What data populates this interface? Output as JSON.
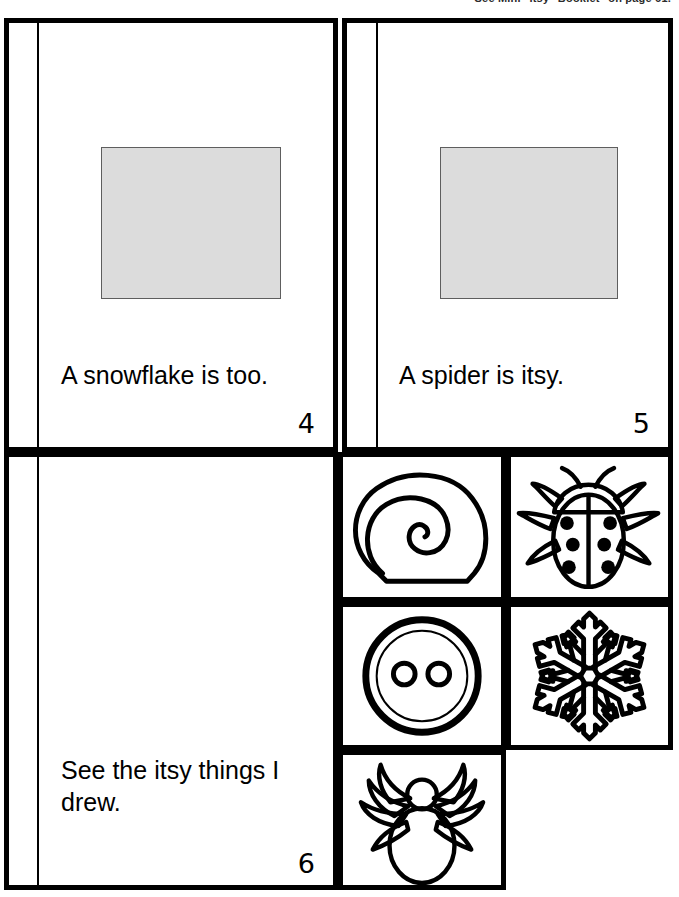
{
  "header": {
    "note": "See Mini \"Itsy\" Booklet\" on page 61."
  },
  "booklet": {
    "pages": [
      {
        "id": "page-4",
        "caption": "A snowflake is too.",
        "page_number": "4",
        "has_photo_box": true,
        "photo_box_color": "#dcdcdc"
      },
      {
        "id": "page-5",
        "caption": "A spider is itsy.",
        "page_number": "5",
        "has_photo_box": true,
        "photo_box_color": "#dcdcdc"
      },
      {
        "id": "page-6",
        "caption": "See the itsy things I drew.",
        "page_number": "6",
        "has_photo_box": false,
        "photo_box_color": "#dcdcdc"
      }
    ]
  },
  "cutouts": {
    "items": [
      {
        "id": "cutout-snail",
        "name": "snail-shell-illustration"
      },
      {
        "id": "cutout-ladybug",
        "name": "ladybug-illustration"
      },
      {
        "id": "cutout-button",
        "name": "button-illustration"
      },
      {
        "id": "cutout-snowflake",
        "name": "snowflake-illustration"
      },
      {
        "id": "cutout-spider",
        "name": "spider-illustration"
      }
    ]
  },
  "colors": {
    "ink": "#000000",
    "photo_placeholder": "#dcdcdc",
    "photo_placeholder_border": "#5e5e5e",
    "paper": "#ffffff"
  }
}
